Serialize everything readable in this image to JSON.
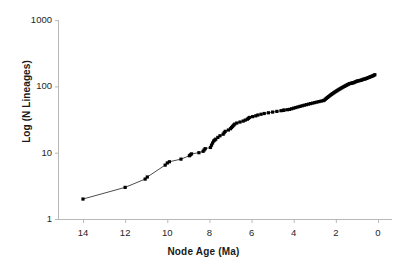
{
  "chart_data": {
    "type": "line",
    "title": "",
    "subtitle": "",
    "xlabel": "Node Age (Ma)",
    "ylabel": "Log (N Lineages)",
    "yscale": "log",
    "xscale": "linear",
    "xlim": [
      15.1,
      -0.15
    ],
    "ylim": [
      1,
      1000
    ],
    "x_reversed": true,
    "grid": false,
    "legend": null,
    "legend_position": "none",
    "x_tick_labels": [
      "14",
      "12",
      "10",
      "8",
      "6",
      "4",
      "2",
      "0"
    ],
    "x_tick_values": [
      14,
      12,
      10,
      8,
      6,
      4,
      2,
      0
    ],
    "y_tick_labels": [
      "1000",
      "100",
      "10",
      "1"
    ],
    "y_tick_values": [
      1000,
      100,
      10,
      1
    ],
    "marker": "filled-square",
    "marker_color": "#000000",
    "line_color": "#000000",
    "axis_color": "#b8b8b8",
    "series": [
      {
        "name": "Lineages through time",
        "x": [
          14.0,
          12.0,
          11.05,
          10.95,
          10.1,
          10.0,
          9.9,
          9.35,
          8.95,
          8.9,
          8.85,
          8.5,
          8.3,
          8.25,
          8.2,
          7.95,
          7.9,
          7.85,
          7.8,
          7.75,
          7.7,
          7.6,
          7.5,
          7.35,
          7.3,
          7.25,
          7.1,
          7.0,
          6.95,
          6.9,
          6.85,
          6.8,
          6.7,
          6.55,
          6.4,
          6.3,
          6.2,
          6.15,
          6.1,
          5.95,
          5.8,
          5.7,
          5.55,
          5.4,
          5.2,
          5.0,
          4.8,
          4.6,
          4.5,
          4.45,
          4.3,
          4.2,
          4.1,
          4.0,
          3.9,
          3.8,
          3.7,
          3.6,
          3.5,
          3.4,
          3.3,
          3.2,
          3.1,
          3.0,
          2.9,
          2.8,
          2.7,
          2.6,
          2.55,
          2.5,
          2.45,
          2.4,
          2.35,
          2.3,
          2.25,
          2.2,
          2.15,
          2.1,
          2.05,
          2.0,
          1.95,
          1.9,
          1.85,
          1.8,
          1.75,
          1.7,
          1.65,
          1.6,
          1.55,
          1.5,
          1.45,
          1.4,
          1.35,
          1.3,
          1.25,
          1.2,
          1.15,
          1.1,
          1.05,
          1.0,
          0.95,
          0.9,
          0.85,
          0.8,
          0.75,
          0.7,
          0.65,
          0.6,
          0.55,
          0.5,
          0.45,
          0.4,
          0.35,
          0.3,
          0.25,
          0.2,
          0.15
        ],
        "y": [
          2,
          3,
          4,
          4.3,
          6.5,
          7,
          7.3,
          8,
          9,
          9.3,
          9.6,
          10,
          10.5,
          11,
          11.5,
          12,
          13,
          14,
          15,
          15.5,
          16,
          17,
          18,
          19,
          20,
          21,
          22,
          23,
          24,
          25,
          26,
          27,
          28,
          29,
          30,
          31,
          32,
          33,
          34,
          35,
          36,
          37,
          38,
          39,
          40,
          41,
          42,
          43,
          43.5,
          44,
          44.5,
          45,
          46,
          47,
          48,
          49,
          50,
          51,
          52,
          53,
          54,
          55,
          56,
          57,
          58,
          59,
          60,
          61,
          62,
          64,
          66,
          68,
          70,
          72,
          74,
          76,
          78,
          80,
          82,
          84,
          86,
          88,
          90,
          92,
          94,
          96,
          98,
          100,
          102,
          104,
          106,
          108,
          110,
          111,
          112,
          113,
          114,
          116,
          118,
          120,
          121,
          122,
          123,
          124,
          126,
          128,
          129,
          130,
          132,
          134,
          136,
          138,
          140,
          142,
          144,
          147,
          150
        ]
      }
    ]
  }
}
